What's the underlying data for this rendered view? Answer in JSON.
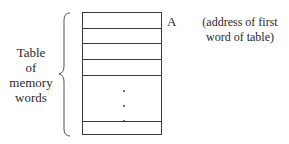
{
  "diagram": {
    "pointer_label": "A",
    "pointer_note_lines": [
      "(address of first",
      "word of table)"
    ],
    "side_label_lines": [
      "Table",
      "of",
      "memory",
      "words"
    ],
    "table": {
      "visible_rows_top": 4,
      "ellipsis": "vertical-dots",
      "visible_rows_bottom": 1
    }
  }
}
